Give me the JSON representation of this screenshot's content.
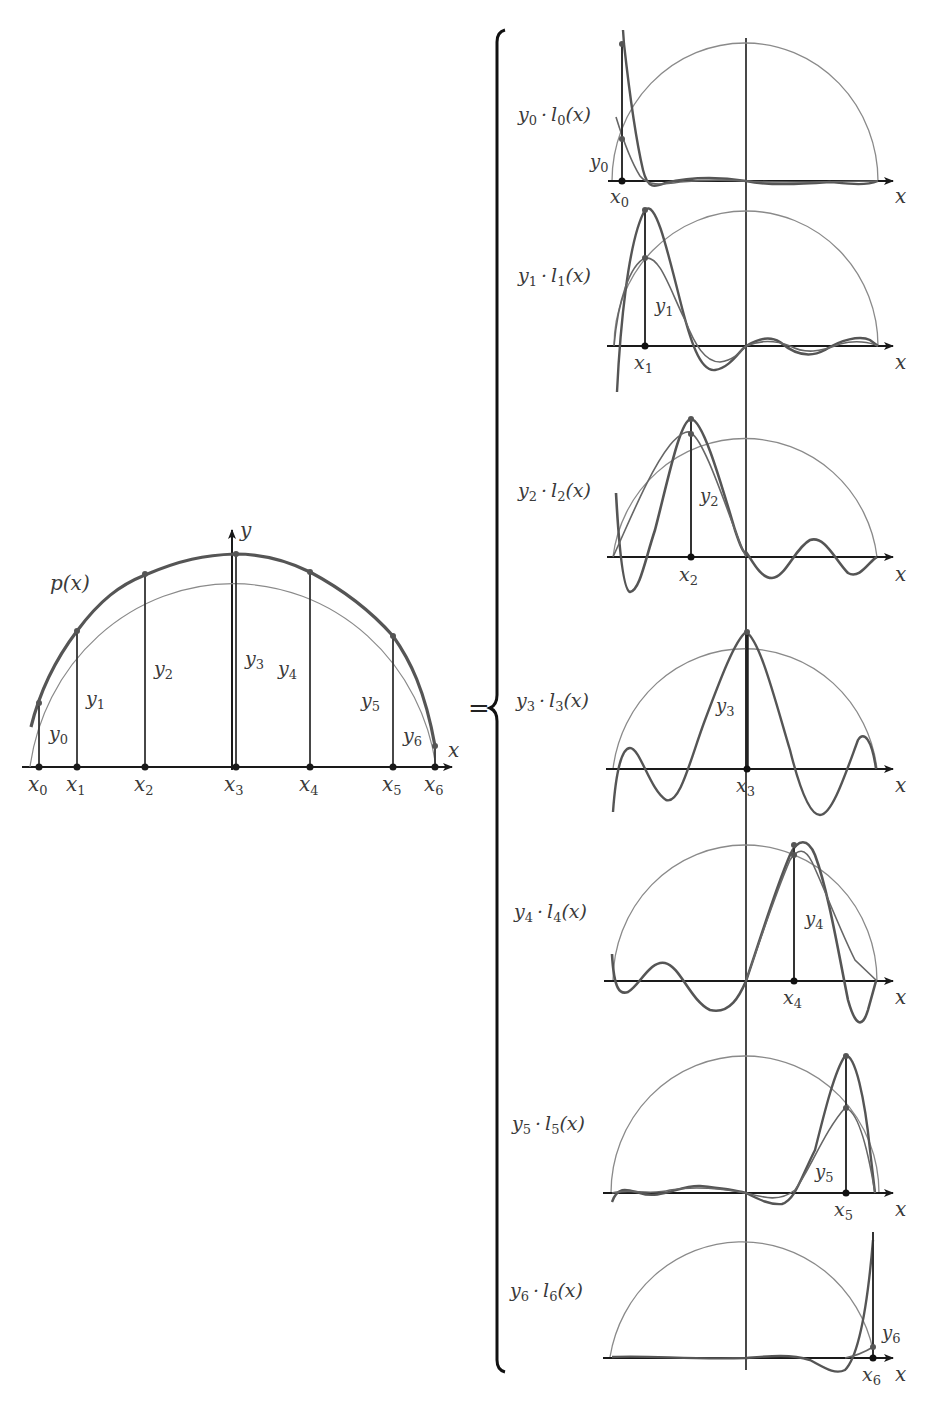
{
  "figure": {
    "equals_sign": "=",
    "colors": {
      "ink": "#1a1a1a",
      "curve": "#555555",
      "semicircle": "#8a8a8a",
      "paper": "#ffffff"
    }
  },
  "left_plot": {
    "curve_label": "p(x)",
    "x_axis_label": "x",
    "y_axis_label": "y",
    "nodes": [
      {
        "x_label": "x",
        "x_sub": "0",
        "y_label": "y",
        "y_sub": "0"
      },
      {
        "x_label": "x",
        "x_sub": "1",
        "y_label": "y",
        "y_sub": "1"
      },
      {
        "x_label": "x",
        "x_sub": "2",
        "y_label": "y",
        "y_sub": "2"
      },
      {
        "x_label": "x",
        "x_sub": "3",
        "y_label": "y",
        "y_sub": "3"
      },
      {
        "x_label": "x",
        "x_sub": "4",
        "y_label": "y",
        "y_sub": "4"
      },
      {
        "x_label": "x",
        "x_sub": "5",
        "y_label": "y",
        "y_sub": "5"
      },
      {
        "x_label": "x",
        "x_sub": "6",
        "y_label": "y",
        "y_sub": "6"
      }
    ]
  },
  "panels": [
    {
      "term": "y",
      "term_sub": "0",
      "basis": "l",
      "basis_sub": "0",
      "arg": "(x)",
      "node_x": "x",
      "node_x_sub": "0",
      "node_y": "y",
      "node_y_sub": "0",
      "axis_label": "x"
    },
    {
      "term": "y",
      "term_sub": "1",
      "basis": "l",
      "basis_sub": "1",
      "arg": "(x)",
      "node_x": "x",
      "node_x_sub": "1",
      "node_y": "y",
      "node_y_sub": "1",
      "axis_label": "x"
    },
    {
      "term": "y",
      "term_sub": "2",
      "basis": "l",
      "basis_sub": "2",
      "arg": "(x)",
      "node_x": "x",
      "node_x_sub": "2",
      "node_y": "y",
      "node_y_sub": "2",
      "axis_label": "x"
    },
    {
      "term": "y",
      "term_sub": "3",
      "basis": "l",
      "basis_sub": "3",
      "arg": "(x)",
      "node_x": "x",
      "node_x_sub": "3",
      "node_y": "y",
      "node_y_sub": "3",
      "axis_label": "x"
    },
    {
      "term": "y",
      "term_sub": "4",
      "basis": "l",
      "basis_sub": "4",
      "arg": "(x)",
      "node_x": "x",
      "node_x_sub": "4",
      "node_y": "y",
      "node_y_sub": "4",
      "axis_label": "x"
    },
    {
      "term": "y",
      "term_sub": "5",
      "basis": "l",
      "basis_sub": "5",
      "arg": "(x)",
      "node_x": "x",
      "node_x_sub": "5",
      "node_y": "y",
      "node_y_sub": "5",
      "axis_label": "x"
    },
    {
      "term": "y",
      "term_sub": "6",
      "basis": "l",
      "basis_sub": "6",
      "arg": "(x)",
      "node_x": "x",
      "node_x_sub": "6",
      "node_y": "y",
      "node_y_sub": "6",
      "axis_label": "x"
    }
  ],
  "dot_operator": "·"
}
